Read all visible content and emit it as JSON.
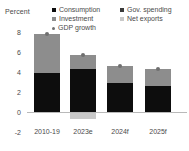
{
  "chart_data": {
    "type": "bar",
    "title": "",
    "ylabel": "Percent",
    "xlabel": "",
    "ylim": [
      -2,
      8
    ],
    "yticks": [
      8,
      6,
      4,
      2,
      0,
      -2
    ],
    "grid": false,
    "stacked": true,
    "legend_position": "top",
    "categories": [
      "2010-19",
      "2023e",
      "2024f",
      "2025f"
    ],
    "series": [
      {
        "name": "Consumption",
        "color": "#0d0d0d",
        "marker": "square",
        "values": [
          3.9,
          4.3,
          2.9,
          2.6
        ]
      },
      {
        "name": "Gov. spending",
        "color": "#3a3a3a",
        "marker": "square",
        "values": [
          0.0,
          0.0,
          0.0,
          0.0
        ]
      },
      {
        "name": "Investment",
        "color": "#8d8d8d",
        "marker": "square",
        "values": [
          3.9,
          1.4,
          1.7,
          1.7
        ]
      },
      {
        "name": "Net exports",
        "color": "#c9c9c9",
        "marker": "square",
        "values": [
          0.0,
          -0.6,
          0.0,
          0.0
        ]
      },
      {
        "name": "GDP growth",
        "color": "#6f6f6f",
        "marker": "dot",
        "values": [
          7.8,
          5.7,
          4.6,
          4.3
        ]
      }
    ],
    "bars": [
      {
        "category": "2010-19",
        "stack_top": 7.8,
        "stack_bottom": 0.0,
        "dark": 3.9,
        "gray": 3.9,
        "neg_gray": 0.0,
        "gdp": 7.8
      },
      {
        "category": "2023e",
        "stack_top": 5.7,
        "stack_bottom": -0.6,
        "dark": 4.3,
        "gray": 1.4,
        "neg_gray": -0.6,
        "gdp": 5.7
      },
      {
        "category": "2024f",
        "stack_top": 4.6,
        "stack_bottom": 0.0,
        "dark": 2.9,
        "gray": 1.7,
        "neg_gray": 0.0,
        "gdp": 4.6
      },
      {
        "category": "2025f",
        "stack_top": 4.3,
        "stack_bottom": 0.0,
        "dark": 2.6,
        "gray": 1.7,
        "neg_gray": 0.0,
        "gdp": 4.3
      }
    ]
  },
  "axis": {
    "percent_label": "Percent",
    "yticks": [
      "8",
      "6",
      "4",
      "2",
      "0",
      "-2"
    ],
    "xticks": [
      "2010-19",
      "2023e",
      "2024f",
      "2025f"
    ]
  },
  "legend": {
    "consumption": "Consumption",
    "gov_spending": "Gov. spending",
    "investment": "Investment",
    "net_exports": "Net exports",
    "gdp_growth": "GDP growth"
  },
  "colors": {
    "consumption": "#0d0d0d",
    "gov_spending": "#3a3a3a",
    "investment": "#8d8d8d",
    "net_exports": "#c9c9c9",
    "gdp_growth": "#6f6f6f",
    "axis": "#b9b9b9",
    "text": "#4a4a4a",
    "background": "#ffffff"
  }
}
